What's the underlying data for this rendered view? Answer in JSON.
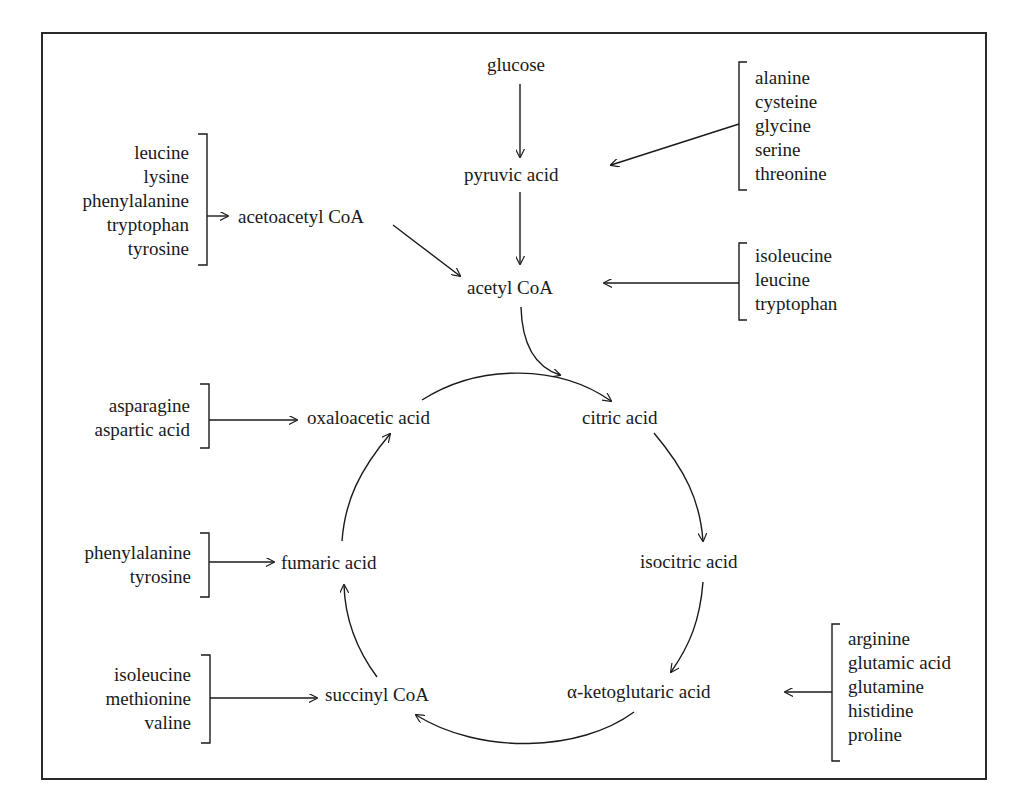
{
  "diagram": {
    "nodes": {
      "glucose": "glucose",
      "pyruvic_acid": "pyruvic acid",
      "acetoacetyl_coa": "acetoacetyl CoA",
      "acetyl_coa": "acetyl CoA",
      "oxaloacetic_acid": "oxaloacetic acid",
      "citric_acid": "citric acid",
      "isocitric_acid": "isocitric acid",
      "alpha_ketoglutaric_acid": "α-ketoglutaric acid",
      "succinyl_coa": "succinyl CoA",
      "fumaric_acid": "fumaric acid"
    },
    "groups": {
      "to_pyruvic": [
        "alanine",
        "cysteine",
        "glycine",
        "serine",
        "threonine"
      ],
      "to_acetoacetyl": [
        "leucine",
        "lysine",
        "phenylalanine",
        "tryptophan",
        "tyrosine"
      ],
      "to_acetyl": [
        "isoleucine",
        "leucine",
        "tryptophan"
      ],
      "to_oxaloacetic": [
        "asparagine",
        "aspartic acid"
      ],
      "to_fumaric": [
        "phenylalanine",
        "tyrosine"
      ],
      "to_succinyl": [
        "isoleucine",
        "methionine",
        "valine"
      ],
      "to_ketoglutaric": [
        "arginine",
        "glutamic acid",
        "glutamine",
        "histidine",
        "proline"
      ]
    },
    "edges": [
      [
        "glucose",
        "pyruvic acid"
      ],
      [
        "pyruvic acid",
        "acetyl CoA"
      ],
      [
        "acetoacetyl CoA",
        "acetyl CoA"
      ],
      [
        "acetyl CoA",
        "citric acid"
      ],
      [
        "oxaloacetic acid",
        "citric acid"
      ],
      [
        "citric acid",
        "isocitric acid"
      ],
      [
        "isocitric acid",
        "α-ketoglutaric acid"
      ],
      [
        "α-ketoglutaric acid",
        "succinyl CoA"
      ],
      [
        "succinyl CoA",
        "fumaric acid"
      ],
      [
        "fumaric acid",
        "oxaloacetic acid"
      ]
    ],
    "colors": {
      "ink": "#1a1a1a",
      "background": "#ffffff"
    }
  }
}
